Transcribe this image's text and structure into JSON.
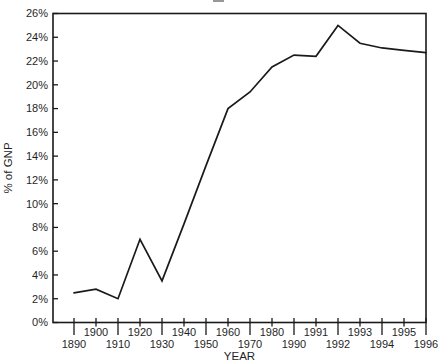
{
  "figure": {
    "x_axis_title": "YEAR",
    "y_axis_title": "% of GNP"
  },
  "chart_data": {
    "type": "line",
    "title": "",
    "xlabel": "YEAR",
    "ylabel": "% of GNP",
    "categories": [
      "1890",
      "1900",
      "1910",
      "1920",
      "1930",
      "1940",
      "1950",
      "1960",
      "1970",
      "1980",
      "1990",
      "1991",
      "1992",
      "1993",
      "1994",
      "1995",
      "1996"
    ],
    "values": [
      2.5,
      2.8,
      2.0,
      7.0,
      3.5,
      8.3,
      13.2,
      18.0,
      19.4,
      21.5,
      22.5,
      22.4,
      25.0,
      23.5,
      23.1,
      22.9,
      22.7
    ],
    "series": [
      {
        "name": "% of GNP",
        "values": [
          2.5,
          2.8,
          2.0,
          7.0,
          3.5,
          8.3,
          13.2,
          18.0,
          19.4,
          21.5,
          22.5,
          22.4,
          25.0,
          23.5,
          23.1,
          22.9,
          22.7
        ]
      }
    ],
    "y_axis": {
      "min": 0,
      "max": 26,
      "step": 2,
      "tick_labels": [
        "0%",
        "2%",
        "4%",
        "6%",
        "8%",
        "10%",
        "12%",
        "14%",
        "16%",
        "18%",
        "20%",
        "22%",
        "24%",
        "26%"
      ]
    },
    "x_tick_label_rows": {
      "upper": [
        "1900",
        "1920",
        "1940",
        "1960",
        "1980",
        "1991",
        "1993",
        "1995"
      ],
      "lower": [
        "1890",
        "1910",
        "1930",
        "1950",
        "1970",
        "1990",
        "1992",
        "1994",
        "1996"
      ]
    },
    "ylim": [
      0,
      26
    ],
    "grid": "off",
    "legend": "none",
    "line_color": "#1a1a1a",
    "axis_color": "#1a1a1a",
    "background_color": "#ffffff"
  }
}
